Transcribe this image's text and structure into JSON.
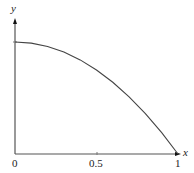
{
  "chart_data": {
    "type": "line",
    "title": "",
    "xlabel": "x",
    "ylabel": "y",
    "x_ticks": [
      "0",
      "0.5",
      "1"
    ],
    "xlim": [
      0,
      1
    ],
    "ylim": [
      0,
      1
    ],
    "grid": false,
    "legend": null,
    "series": [
      {
        "name": "y = 1 - x^2",
        "x": [
          0,
          0.1,
          0.2,
          0.3,
          0.4,
          0.5,
          0.6,
          0.7,
          0.8,
          0.9,
          1.0
        ],
        "values": [
          1.0,
          0.99,
          0.96,
          0.91,
          0.84,
          0.75,
          0.64,
          0.51,
          0.36,
          0.19,
          0.0
        ]
      }
    ]
  },
  "labels": {
    "y_axis": "y",
    "x_axis": "x",
    "tick_0": "0",
    "tick_half": "0.5",
    "tick_1": "1"
  }
}
